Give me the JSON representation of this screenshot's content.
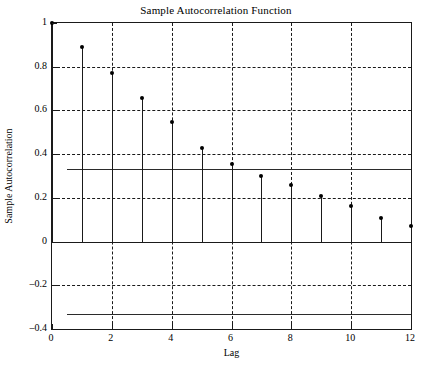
{
  "chart_data": {
    "type": "bar",
    "title": "Sample Autocorrelation Function",
    "xlabel": "Lag",
    "ylabel": "Sample Autocorrelation",
    "categories": [
      0,
      1,
      2,
      3,
      4,
      5,
      6,
      7,
      8,
      9,
      10,
      11,
      12
    ],
    "values": [
      1.0,
      0.89,
      0.77,
      0.655,
      0.545,
      0.43,
      0.355,
      0.3,
      0.26,
      0.21,
      0.165,
      0.11,
      0.07
    ],
    "series": [
      {
        "name": "Sample Autocorrelation",
        "values": [
          1.0,
          0.89,
          0.77,
          0.655,
          0.545,
          0.43,
          0.355,
          0.3,
          0.26,
          0.21,
          0.165,
          0.11,
          0.07
        ]
      }
    ],
    "xlim": [
      0,
      12
    ],
    "ylim": [
      -0.4,
      1.0
    ],
    "xticks": [
      0,
      2,
      4,
      6,
      8,
      10,
      12
    ],
    "xtick_labels": [
      "0",
      "2",
      "4",
      "6",
      "8",
      "10",
      "12"
    ],
    "yticks": [
      -0.4,
      -0.2,
      0,
      0.2,
      0.4,
      0.6,
      0.8,
      1
    ],
    "ytick_labels": [
      "-0.4",
      "-0.2",
      "0",
      "0.2",
      "0.4",
      "0.6",
      "0.8",
      "1"
    ],
    "grid": true,
    "grid_style": "dashed",
    "legend": false,
    "zero_line": 0,
    "confidence_bounds": {
      "upper": 0.33,
      "lower": -0.33,
      "style": "solid",
      "x_start": 0.5,
      "x_end": 12
    },
    "marker": "filled-circle",
    "stem_style": "solid",
    "colors": {
      "axis": "#1a1a1a",
      "grid": "#1a1a1a",
      "stem": "#1a1a1a",
      "marker": "#000000",
      "bounds": "#2b2b2b",
      "background": "#ffffff"
    }
  }
}
